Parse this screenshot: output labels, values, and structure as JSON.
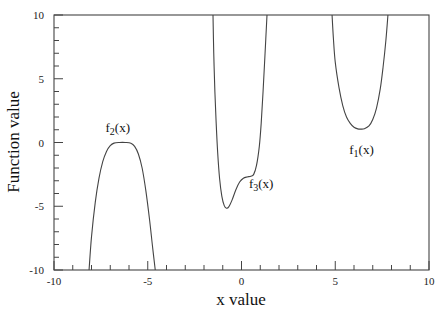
{
  "chart_data": {
    "type": "line",
    "title": "",
    "xlabel": "x value",
    "ylabel": "Function value",
    "xlim": [
      -10,
      10
    ],
    "ylim": [
      -10,
      10
    ],
    "grid": false,
    "legend": "none (inline curve labels)",
    "x_ticks": [
      -10,
      -5,
      0,
      5,
      10
    ],
    "y_ticks": [
      10,
      5,
      0,
      -5,
      -10
    ],
    "x_minor_step": 1,
    "y_minor_step": 1,
    "series": [
      {
        "name": "f1(x)",
        "label_main": "f",
        "label_sub": "1",
        "label_tail": "(x)",
        "label_pos": [
          6.4,
          -0.9
        ],
        "points": [
          [
            4.83,
            10
          ],
          [
            4.9,
            8.2
          ],
          [
            5.0,
            6.3
          ],
          [
            5.2,
            4.3
          ],
          [
            5.4,
            2.9
          ],
          [
            5.6,
            2.0
          ],
          [
            5.8,
            1.5
          ],
          [
            6.0,
            1.2
          ],
          [
            6.2,
            1.07
          ],
          [
            6.37,
            1.05
          ],
          [
            6.55,
            1.08
          ],
          [
            6.8,
            1.3
          ],
          [
            7.0,
            1.8
          ],
          [
            7.2,
            2.7
          ],
          [
            7.4,
            4.2
          ],
          [
            7.55,
            5.9
          ],
          [
            7.7,
            8.0
          ],
          [
            7.81,
            10
          ]
        ]
      },
      {
        "name": "f2(x)",
        "label_main": "f",
        "label_sub": "2",
        "label_tail": "(x)",
        "label_pos": [
          -6.6,
          0.8
        ],
        "points": [
          [
            -8.13,
            -10
          ],
          [
            -8.0,
            -7.4
          ],
          [
            -7.8,
            -4.7
          ],
          [
            -7.6,
            -2.8
          ],
          [
            -7.4,
            -1.5
          ],
          [
            -7.2,
            -0.7
          ],
          [
            -7.0,
            -0.25
          ],
          [
            -6.8,
            -0.05
          ],
          [
            -6.5,
            0.0
          ],
          [
            -6.2,
            0.0
          ],
          [
            -5.9,
            -0.05
          ],
          [
            -5.7,
            -0.3
          ],
          [
            -5.5,
            -0.9
          ],
          [
            -5.3,
            -2.0
          ],
          [
            -5.1,
            -3.8
          ],
          [
            -4.9,
            -6.1
          ],
          [
            -4.75,
            -8.1
          ],
          [
            -4.6,
            -10
          ]
        ]
      },
      {
        "name": "f3(x)",
        "label_main": "f",
        "label_sub": "3",
        "label_tail": "(x)",
        "label_pos": [
          1.05,
          -3.6
        ],
        "points": [
          [
            -1.52,
            10
          ],
          [
            -1.48,
            7.0
          ],
          [
            -1.42,
            4.0
          ],
          [
            -1.35,
            1.5
          ],
          [
            -1.27,
            -0.8
          ],
          [
            -1.17,
            -2.8
          ],
          [
            -1.05,
            -4.2
          ],
          [
            -0.92,
            -4.95
          ],
          [
            -0.8,
            -5.15
          ],
          [
            -0.68,
            -5.05
          ],
          [
            -0.5,
            -4.5
          ],
          [
            -0.3,
            -3.7
          ],
          [
            -0.1,
            -3.1
          ],
          [
            0.1,
            -2.8
          ],
          [
            0.3,
            -2.7
          ],
          [
            0.5,
            -2.65
          ],
          [
            0.65,
            -2.5
          ],
          [
            0.8,
            -1.8
          ],
          [
            0.95,
            -0.3
          ],
          [
            1.05,
            1.5
          ],
          [
            1.15,
            4.0
          ],
          [
            1.25,
            6.8
          ],
          [
            1.36,
            10
          ]
        ]
      }
    ]
  },
  "axes": {
    "x_title": "x value",
    "y_title": "Function value",
    "x_tick_labels": [
      "-10",
      "-5",
      "0",
      "5",
      "10"
    ],
    "y_tick_labels": [
      "10",
      "5",
      "0",
      "-5",
      "-10"
    ]
  }
}
